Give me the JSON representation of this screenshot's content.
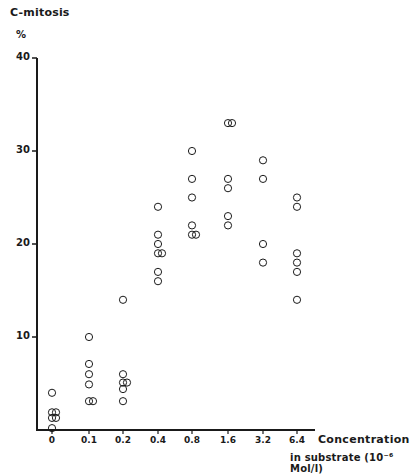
{
  "chart_data": {
    "type": "scatter",
    "title": "C-mitosis",
    "ylabel": "%",
    "xlabel": "Concentration in substrate (10⁻⁶ Mol/l)",
    "xlabel_line1": "Concentration",
    "xlabel_line2": "in substrate (10⁻⁶ Mol/l)",
    "ylim": [
      0,
      40
    ],
    "yticks": [
      10,
      20,
      30,
      40
    ],
    "categories": [
      "0",
      "0.1",
      "0.2",
      "0.4",
      "0.8",
      "1.6",
      "3.2",
      "6.4"
    ],
    "x_scale": "categorical (log-spaced doubling)",
    "grid": false,
    "legend": null,
    "marker": "open circle",
    "points": [
      {
        "x": "0",
        "values": [
          4.0,
          1.9,
          1.9,
          1.3,
          1.3,
          0.2
        ]
      },
      {
        "x": "0.1",
        "values": [
          10.0,
          7.1,
          6.0,
          4.9,
          3.1,
          3.1
        ]
      },
      {
        "x": "0.2",
        "values": [
          14.0,
          6.0,
          5.1,
          5.1,
          4.4,
          3.1
        ]
      },
      {
        "x": "0.4",
        "values": [
          24.0,
          21.0,
          20.0,
          19.0,
          19.0,
          17.0,
          16.0
        ]
      },
      {
        "x": "0.8",
        "values": [
          30.0,
          27.0,
          25.0,
          22.0,
          21.0,
          21.0
        ]
      },
      {
        "x": "1.6",
        "values": [
          33.0,
          33.0,
          27.0,
          26.0,
          23.0,
          22.0
        ]
      },
      {
        "x": "3.2",
        "values": [
          29.0,
          27.0,
          20.0,
          18.0
        ]
      },
      {
        "x": "6.4",
        "values": [
          25.0,
          24.0,
          19.0,
          18.0,
          17.0,
          14.0
        ]
      }
    ]
  },
  "labels": {
    "title": "C-mitosis",
    "unit": "%",
    "yticks": [
      "10",
      "20",
      "30",
      "40"
    ],
    "xticks": [
      "0",
      "0.1",
      "0.2",
      "0.4",
      "0.8",
      "1.6",
      "3.2",
      "6.4"
    ],
    "xlabel_line1": "Concentration",
    "xlabel_line2": "in substrate (10⁻⁶ Mol/l)"
  },
  "colors": {
    "ink": "#1a1a1a",
    "background": "#ffffff"
  }
}
